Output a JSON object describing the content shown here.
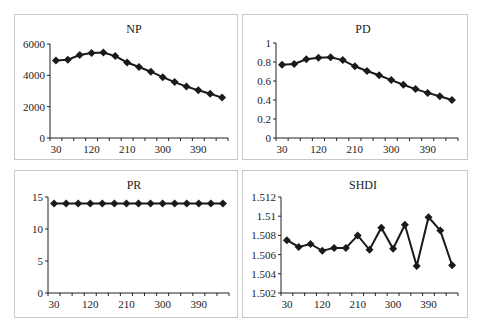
{
  "chart_data": [
    {
      "type": "line",
      "title": "NP",
      "xlabel": "",
      "ylabel": "",
      "x": [
        30,
        60,
        90,
        120,
        150,
        180,
        210,
        240,
        270,
        300,
        330,
        360,
        390,
        420,
        450
      ],
      "xticklabels": [
        "30",
        "120",
        "210",
        "300",
        "390"
      ],
      "yticks": [
        0,
        2000,
        4000,
        6000
      ],
      "ylim": [
        0,
        6000
      ],
      "series": [
        {
          "name": "NP",
          "values": [
            4950,
            5000,
            5300,
            5420,
            5450,
            5230,
            4820,
            4530,
            4230,
            3880,
            3570,
            3280,
            3050,
            2830,
            2580
          ]
        }
      ],
      "marker": "diamond",
      "legend": "none",
      "grid": false
    },
    {
      "type": "line",
      "title": "PD",
      "xlabel": "",
      "ylabel": "",
      "x": [
        30,
        60,
        90,
        120,
        150,
        180,
        210,
        240,
        270,
        300,
        330,
        360,
        390,
        420,
        450
      ],
      "xticklabels": [
        "30",
        "120",
        "210",
        "300",
        "390"
      ],
      "yticks": [
        0,
        0.2,
        0.4,
        0.6,
        0.8,
        1
      ],
      "ylim": [
        0,
        1
      ],
      "series": [
        {
          "name": "PD",
          "values": [
            0.77,
            0.78,
            0.83,
            0.845,
            0.85,
            0.82,
            0.755,
            0.705,
            0.66,
            0.61,
            0.56,
            0.515,
            0.475,
            0.44,
            0.4
          ]
        }
      ],
      "marker": "diamond",
      "legend": "none",
      "grid": false
    },
    {
      "type": "line",
      "title": "PR",
      "xlabel": "",
      "ylabel": "",
      "x": [
        30,
        60,
        90,
        120,
        150,
        180,
        210,
        240,
        270,
        300,
        330,
        360,
        390,
        420,
        450
      ],
      "xticklabels": [
        "30",
        "120",
        "210",
        "300",
        "390"
      ],
      "yticks": [
        0,
        5,
        10,
        15
      ],
      "ylim": [
        0,
        15
      ],
      "series": [
        {
          "name": "PR",
          "values": [
            14,
            14,
            14,
            14,
            14,
            14,
            14,
            14,
            14,
            14,
            14,
            14,
            14,
            14,
            14
          ]
        }
      ],
      "marker": "diamond",
      "legend": "none",
      "grid": false
    },
    {
      "type": "line",
      "title": "SHDI",
      "xlabel": "",
      "ylabel": "",
      "x": [
        30,
        60,
        90,
        120,
        150,
        180,
        210,
        240,
        270,
        300,
        330,
        360,
        390,
        420,
        450
      ],
      "xticklabels": [
        "30",
        "120",
        "210",
        "300",
        "390"
      ],
      "yticks": [
        1.502,
        1.504,
        1.506,
        1.508,
        1.51,
        1.512
      ],
      "ylim": [
        1.502,
        1.512
      ],
      "series": [
        {
          "name": "SHDI",
          "values": [
            1.5075,
            1.5068,
            1.5071,
            1.5064,
            1.5067,
            1.5067,
            1.508,
            1.5065,
            1.5088,
            1.5066,
            1.5091,
            1.5048,
            1.5099,
            1.5085,
            1.5049
          ]
        }
      ],
      "marker": "diamond",
      "legend": "none",
      "grid": false
    }
  ],
  "layout": {
    "panels": [
      {
        "left": 14,
        "top": 14,
        "width": 224,
        "height": 146,
        "plot": {
          "x0": 50,
          "x1": 228,
          "y0": 44,
          "y1": 138
        },
        "ylabels": [
          "0",
          "2000",
          "4000",
          "6000"
        ]
      },
      {
        "left": 242,
        "top": 14,
        "width": 226,
        "height": 146,
        "plot": {
          "x0": 276,
          "x1": 458,
          "y0": 43,
          "y1": 138
        },
        "ylabels": [
          "0",
          "0.2",
          "0.4",
          "0.6",
          "0.8",
          "1"
        ]
      },
      {
        "left": 14,
        "top": 170,
        "width": 224,
        "height": 148,
        "plot": {
          "x0": 48,
          "x1": 229,
          "y0": 197,
          "y1": 293
        },
        "ylabels": [
          "0",
          "5",
          "10",
          "15"
        ]
      },
      {
        "left": 242,
        "top": 170,
        "width": 226,
        "height": 148,
        "plot": {
          "x0": 281,
          "x1": 458,
          "y0": 197,
          "y1": 293
        },
        "ylabels": [
          "1.502",
          "1.504",
          "1.506",
          "1.508",
          "1.51",
          "1.512"
        ]
      }
    ],
    "line_color": "#1a1a1a",
    "axis_color": "#222222",
    "border_color": "#c8c8c8"
  }
}
